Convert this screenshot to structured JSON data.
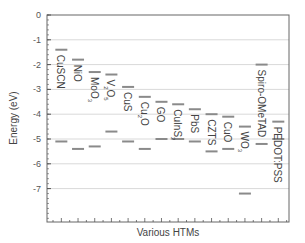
{
  "chart_data": {
    "type": "energy-level-diagram",
    "title": "",
    "xlabel": "Various HTMs",
    "ylabel": "Energy (eV)",
    "ylim": [
      -8.3,
      0
    ],
    "yticks": [
      0,
      -1,
      -2,
      -3,
      -4,
      -5,
      -6,
      -7
    ],
    "grid": true,
    "legend": null,
    "categories": [
      "CuSCN",
      "NiO",
      "MoO3",
      "V2O5",
      "CuS",
      "Cu2O",
      "GO",
      "CuInS2",
      "PbS",
      "CZTS",
      "CuO",
      "WO3",
      "Spiro-OMeTAD",
      "PEDOT:PSS"
    ],
    "series": [
      {
        "name": "LUMO / conduction band (upper level)",
        "values": [
          -1.4,
          -1.8,
          -2.3,
          -2.4,
          -2.9,
          -3.3,
          -3.5,
          -3.6,
          -3.8,
          -4.0,
          -4.1,
          -4.5,
          -2.0,
          -4.3
        ]
      },
      {
        "name": "HOMO / valence band (lower level)",
        "values": [
          -5.1,
          -5.4,
          -5.3,
          -4.7,
          -5.1,
          -5.4,
          -5.0,
          -5.0,
          -5.1,
          -5.5,
          -5.4,
          -7.2,
          -5.2,
          -5.0
        ]
      }
    ],
    "labels": [
      {
        "text": "CuSCN",
        "sub": ""
      },
      {
        "text": "NiO",
        "sub": ""
      },
      {
        "text": "MoO",
        "sub": "3"
      },
      {
        "text": "V",
        "sub": "2",
        "text2": "O",
        "sub2": "5"
      },
      {
        "text": "CuS",
        "sub": ""
      },
      {
        "text": "Cu",
        "sub": "2",
        "text2": "O",
        "sub2": ""
      },
      {
        "text": "GO",
        "sub": ""
      },
      {
        "text": "CuInS",
        "sub": "2"
      },
      {
        "text": "PbS",
        "sub": ""
      },
      {
        "text": "CZTS",
        "sub": ""
      },
      {
        "text": "CuO",
        "sub": ""
      },
      {
        "text": "WO",
        "sub": "3"
      },
      {
        "text": "Spiro-OMeTAD",
        "sub": ""
      },
      {
        "text": "PEDOT:PSS",
        "sub": ""
      }
    ]
  },
  "colors": {
    "level_line": "#8a8a8a",
    "grid": "#d9d9d9",
    "axis": "#555555"
  }
}
